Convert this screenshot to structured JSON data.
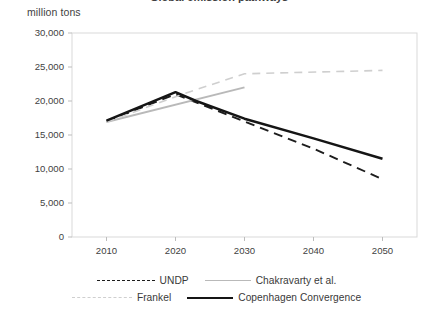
{
  "chart_data": {
    "type": "line",
    "title": "Global emission pathways",
    "subtitle": "",
    "ylabel": "million tons",
    "xlabel": "",
    "xlim": [
      2005,
      2055
    ],
    "ylim": [
      0,
      30000
    ],
    "ytick_labels": [
      "30,000",
      "25,000",
      "20,000",
      "15,000",
      "10,000",
      "5,000",
      "0"
    ],
    "ytick_values": [
      30000,
      25000,
      20000,
      15000,
      10000,
      5000,
      0
    ],
    "xtick_labels": [
      "2010",
      "2020",
      "2030",
      "2040",
      "2050"
    ],
    "xtick_values": [
      2010,
      2020,
      2030,
      2040,
      2050
    ],
    "grid": false,
    "legend_position": "bottom",
    "series": [
      {
        "name": "UNDP",
        "style": "dashed",
        "color": "#1d1d1d",
        "x": [
          2010,
          2020,
          2022,
          2030,
          2040,
          2050
        ],
        "values": [
          17000,
          21000,
          20200,
          17000,
          13000,
          8500
        ]
      },
      {
        "name": "Chakravarty et al.",
        "style": "solid",
        "color": "#b9b9b9",
        "x": [
          2010,
          2030
        ],
        "values": [
          16900,
          22000
        ]
      },
      {
        "name": "Frankel",
        "style": "dashed",
        "color": "#cfcfcf",
        "x": [
          2010,
          2021,
          2030,
          2050
        ],
        "values": [
          16900,
          21000,
          24000,
          24500
        ]
      },
      {
        "name": "Copenhagen Convergence",
        "style": "solid",
        "color": "#151515",
        "x": [
          2010,
          2020,
          2023,
          2030,
          2040,
          2050
        ],
        "values": [
          17100,
          21300,
          20000,
          17400,
          14500,
          11500
        ]
      }
    ]
  },
  "legend": {
    "items": [
      {
        "label": "UNDP"
      },
      {
        "label": "Chakravarty et al."
      },
      {
        "label": "Frankel"
      },
      {
        "label": "Copenhagen Convergence"
      }
    ]
  }
}
